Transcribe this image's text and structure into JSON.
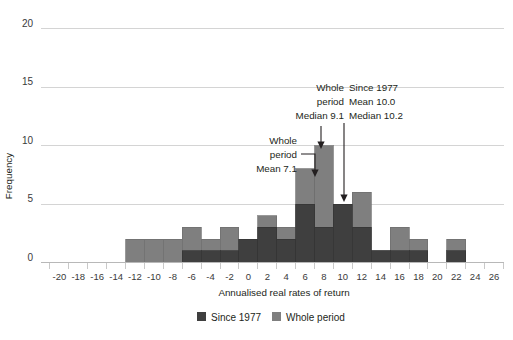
{
  "chart_data": {
    "type": "bar",
    "title": "",
    "xlabel": "Annualised real rates of return",
    "ylabel": "Frequency",
    "ylim": [
      0,
      20
    ],
    "yticks": [
      0,
      5,
      10,
      15,
      20
    ],
    "ytick_labels": [
      "0",
      "5",
      "10",
      "15",
      "20"
    ],
    "xlim": [
      -22,
      27
    ],
    "xtick_labels": [
      "-20",
      "-18",
      "-16",
      "-14",
      "-12",
      "-10",
      "-8",
      "-6",
      "-4",
      "-2",
      "0",
      "2",
      "4",
      "6",
      "8",
      "10",
      "12",
      "14",
      "16",
      "18",
      "20",
      "22",
      "24",
      "26"
    ],
    "xtick_values": [
      -20,
      -18,
      -16,
      -14,
      -12,
      -10,
      -8,
      -6,
      -4,
      -2,
      0,
      2,
      4,
      6,
      8,
      10,
      12,
      14,
      16,
      18,
      20,
      22,
      24,
      26
    ],
    "grid": "horizontal",
    "legend_position": "bottom",
    "bin_width": 2,
    "bin_centers": [
      -20,
      -18,
      -16,
      -14,
      -12,
      -10,
      -8,
      -6,
      -4,
      -2,
      0,
      2,
      4,
      6,
      8,
      10,
      12,
      14,
      16,
      18,
      20,
      22,
      24,
      26
    ],
    "series": [
      {
        "name": "Whole period",
        "color": "#7f7f7f",
        "values": [
          0,
          0,
          0,
          0,
          2,
          2,
          2,
          3,
          2,
          3,
          2,
          4,
          3,
          8,
          10,
          5,
          6,
          1,
          3,
          2,
          0,
          2,
          0,
          0
        ]
      },
      {
        "name": "Since 1977",
        "color": "#3f3f3f",
        "values": [
          0,
          0,
          0,
          0,
          0,
          0,
          0,
          1,
          1,
          1,
          2,
          3,
          2,
          5,
          3,
          5,
          3,
          1,
          1,
          1,
          0,
          1,
          0,
          0
        ]
      }
    ],
    "annotations": [
      {
        "id": "whole-period-median",
        "lines": [
          "Whole",
          "period",
          "Median 9.1"
        ],
        "target_x": 8,
        "target_y": 10
      },
      {
        "id": "since-1977-stats",
        "lines": [
          "Since 1977",
          "Mean 10.0",
          "Median 10.2"
        ],
        "target_x": 10,
        "target_y": 5
      },
      {
        "id": "whole-period-mean",
        "lines": [
          "Whole",
          "period",
          "Mean 7.1"
        ],
        "target_x": 7.1,
        "target_y": 8
      }
    ],
    "legend": [
      {
        "label": "Since 1977",
        "color": "#3f3f3f"
      },
      {
        "label": "Whole period",
        "color": "#7f7f7f"
      }
    ]
  },
  "axes": {
    "y_label": "Frequency",
    "x_label": "Annualised real rates of return"
  },
  "annotation_text": {
    "a1_l1": "Whole",
    "a1_l2": "period",
    "a1_l3": "Median 9.1",
    "a2_l1": "Since 1977",
    "a2_l2": "Mean 10.0",
    "a2_l3": "Median 10.2",
    "a3_l1": "Whole",
    "a3_l2": "period",
    "a3_l3": "Mean 7.1"
  },
  "y_ticks": {
    "t0": "0",
    "t1": "5",
    "t2": "10",
    "t3": "15",
    "t4": "20"
  },
  "legend": {
    "item1": "Since 1977",
    "item2": "Whole period"
  },
  "colors": {
    "whole_period": "#7f7f7f",
    "since_1977": "#3f3f3f",
    "grid": "#d4d4d4",
    "text": "#231f20"
  }
}
